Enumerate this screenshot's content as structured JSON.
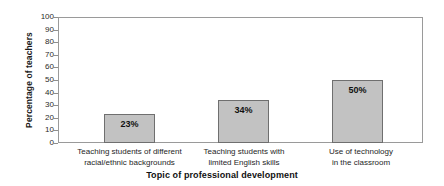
{
  "chart_data": {
    "type": "bar",
    "title": "",
    "xlabel": "Topic of professional development",
    "ylabel": "Percentage of teachers",
    "ylim": [
      0,
      100
    ],
    "ytick_step": 10,
    "yticks": [
      "100",
      "90",
      "80",
      "70",
      "60",
      "50",
      "40",
      "30",
      "20",
      "10",
      "0"
    ],
    "grid": false,
    "legend": "none",
    "bar_color": "#c2c2c2",
    "bar_edge_color": "#6f6f6f",
    "axis_color": "#9a9a9a",
    "categories": [
      "Teaching students of different\nracial/ethnic backgrounds",
      "Teaching students with\nlimited English skills",
      "Use of technology\nin the classroom"
    ],
    "values": [
      23,
      34,
      50
    ],
    "value_labels": [
      "23%",
      "34%",
      "50%"
    ]
  }
}
